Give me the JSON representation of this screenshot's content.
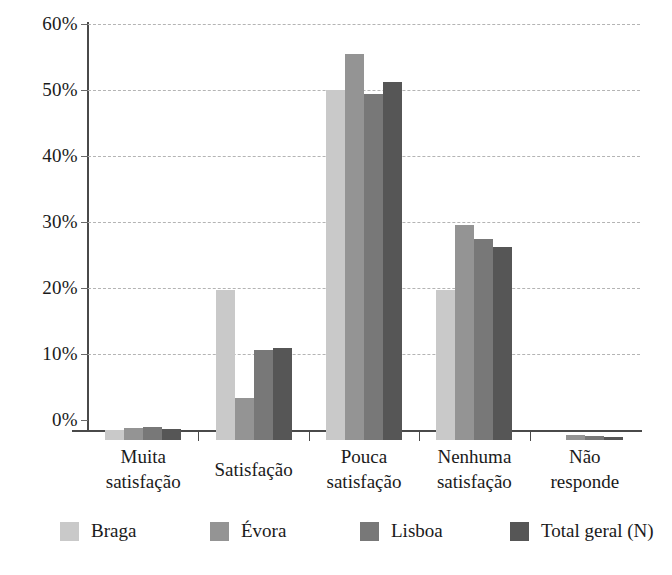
{
  "chart_data": {
    "type": "bar",
    "title": "",
    "subtitle": "",
    "xlabel": "",
    "ylabel": "",
    "ylim": [
      0,
      60
    ],
    "ytick_labels": [
      "0%",
      "10%",
      "20%",
      "30%",
      "40%",
      "50%",
      "60%"
    ],
    "ytick_values": [
      0,
      10,
      20,
      30,
      40,
      50,
      60
    ],
    "grid": true,
    "legend_position": "bottom",
    "categories": [
      "Muita satisfação",
      "Satisfação",
      "Pouca satisfação",
      "Nenhuma satisfação",
      "Não responde"
    ],
    "category_lines": [
      [
        "Muita",
        "satisfação"
      ],
      [
        "Satisfação",
        ""
      ],
      [
        "Pouca",
        "satisfação"
      ],
      [
        "Nenhuma",
        "satisfação"
      ],
      [
        "Não",
        "responde"
      ]
    ],
    "series": [
      {
        "name": "Braga",
        "color": "#c9c9c9",
        "values": [
          1.5,
          22.7,
          53.0,
          22.7,
          0.0
        ]
      },
      {
        "name": "Évora",
        "color": "#949494",
        "values": [
          1.8,
          6.3,
          58.5,
          32.6,
          0.8
        ]
      },
      {
        "name": "Lisboa",
        "color": "#787878",
        "values": [
          1.9,
          13.7,
          52.5,
          30.4,
          0.6
        ]
      },
      {
        "name": "Total geral (N)",
        "color": "#565656",
        "values": [
          1.6,
          14.0,
          54.2,
          29.2,
          0.4
        ]
      }
    ]
  },
  "legend": {
    "items": [
      {
        "label": "Braga"
      },
      {
        "label": "Évora"
      },
      {
        "label": "Lisboa"
      },
      {
        "label": "Total geral (N)"
      }
    ]
  }
}
